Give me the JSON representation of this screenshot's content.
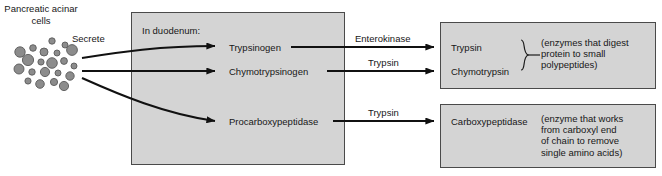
{
  "diagram": {
    "source": {
      "label": "Pancreatic\nacinar\ncells",
      "action_label": "Secrete"
    },
    "duodenum_box": {
      "heading": "In duodenum:",
      "substrates": [
        {
          "name": "Trypsinogen"
        },
        {
          "name": "Chymotrypsinogen"
        },
        {
          "name": "Procarboxypeptidase"
        }
      ]
    },
    "catalysts": [
      {
        "name": "Enterokinase"
      },
      {
        "name": "Trypsin"
      },
      {
        "name": "Trypsin"
      }
    ],
    "products": [
      {
        "names": [
          "Trypsin",
          "Chymotrypsin"
        ],
        "description": "(enzymes that digest\nprotein to small\npolypeptides)",
        "grouped": "true"
      },
      {
        "names": [
          "Carboxypeptidase"
        ],
        "description": "(enzyme that works\nfrom carboxyl end\nof chain to remove\nsingle amino acids)",
        "grouped": "false"
      }
    ],
    "colors": {
      "box_fill": "#d4d4d4",
      "box_border": "#4a4a4a",
      "cell_fill": "#8c8c8c",
      "cell_stroke": "#5a5a5a",
      "arrow": "#111111",
      "text": "#171717",
      "background": "#ffffff"
    }
  }
}
